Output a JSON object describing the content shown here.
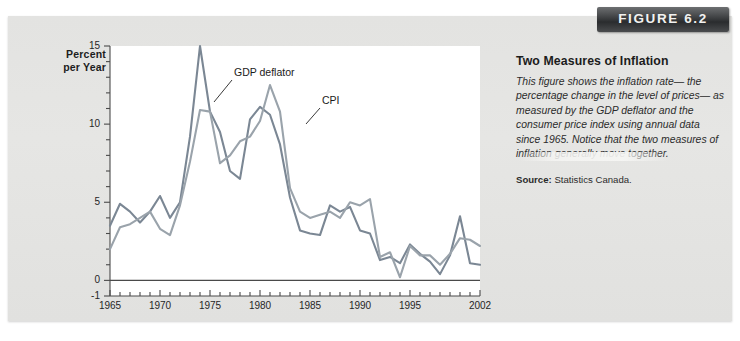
{
  "figure": {
    "banner_label": "FIGURE 6.2",
    "title": "Two Measures of Inflation",
    "caption": "This figure shows the inflation rate— the percentage change in the level of prices— as measured by the GDP deflator and the consumer price index using annual data since 1965. Notice that the two measures of inflation generally move together.",
    "source_label": "Source:",
    "source_value": "Statistics Canada."
  },
  "colors": {
    "gdp_deflator_line": "#7b8794",
    "cpi_line": "#9aa3ab",
    "axis": "#4a4a4a",
    "banner_bg": "#35383a",
    "page_bg": "#e3e3e1"
  },
  "chart_data": {
    "type": "line",
    "title": "",
    "xlabel": "",
    "ylabel": "Percent per Year",
    "ylabel_lines": [
      "Percent",
      "per Year"
    ],
    "grid": false,
    "legend": "inline-annotations",
    "xlim": [
      1965,
      2002
    ],
    "ylim": [
      -1,
      15
    ],
    "yticks": [
      15,
      10,
      5,
      0,
      -1
    ],
    "ytick_labels": [
      "15",
      "10",
      "5",
      "0",
      "-1"
    ],
    "y_minor_tick_step": 1,
    "xticks": [
      1965,
      1970,
      1975,
      1980,
      1985,
      1990,
      1995,
      2002
    ],
    "xtick_labels": [
      "1965",
      "1970",
      "1975",
      "1980",
      "1985",
      "1990",
      "1995",
      "2002"
    ],
    "x_minor_tick_step": 1,
    "x": [
      1965,
      1966,
      1967,
      1968,
      1969,
      1970,
      1971,
      1972,
      1973,
      1974,
      1975,
      1976,
      1977,
      1978,
      1979,
      1980,
      1981,
      1982,
      1983,
      1984,
      1985,
      1986,
      1987,
      1988,
      1989,
      1990,
      1991,
      1992,
      1993,
      1994,
      1995,
      1996,
      1997,
      1998,
      1999,
      2000,
      2001,
      2002
    ],
    "series": [
      {
        "name": "GDP deflator",
        "annotation": "GDP deflator",
        "color": "#7b8794",
        "values": [
          3.5,
          4.9,
          4.4,
          3.7,
          4.4,
          5.4,
          4.0,
          5.0,
          9.2,
          15.0,
          10.8,
          9.5,
          7.0,
          6.5,
          10.3,
          11.1,
          10.6,
          8.7,
          5.3,
          3.2,
          3.0,
          2.9,
          4.8,
          4.4,
          4.7,
          3.2,
          3.0,
          1.3,
          1.5,
          1.1,
          2.3,
          1.7,
          1.2,
          0.4,
          1.6,
          4.1,
          1.1,
          1.0
        ]
      },
      {
        "name": "CPI",
        "annotation": "CPI",
        "color": "#9aa3ab",
        "values": [
          2.0,
          3.4,
          3.6,
          4.0,
          4.4,
          3.3,
          2.9,
          4.8,
          7.6,
          10.9,
          10.8,
          7.5,
          8.0,
          8.9,
          9.2,
          10.2,
          12.5,
          10.8,
          5.9,
          4.4,
          4.0,
          4.2,
          4.4,
          4.0,
          5.0,
          4.8,
          5.2,
          1.5,
          1.8,
          0.2,
          2.2,
          1.6,
          1.6,
          1.0,
          1.7,
          2.7,
          2.6,
          2.2
        ]
      }
    ]
  }
}
